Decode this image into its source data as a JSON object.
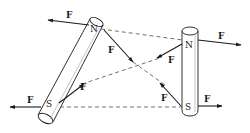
{
  "diagram": {
    "colors": {
      "stroke": "#1a1a1a",
      "fill": "#ffffff",
      "dash": "#333333"
    },
    "magnets": [
      {
        "id": "tilted-magnet",
        "north_label": "N",
        "south_label": "S"
      },
      {
        "id": "vertical-magnet",
        "north_label": "N",
        "south_label": "S"
      }
    ],
    "force_label": "F",
    "forces": [
      {
        "id": "f-n1-left",
        "label": "F",
        "from": "tilted N",
        "direction": "left (repulsion away from N2)"
      },
      {
        "id": "f-n1-toward-s2",
        "label": "F",
        "from": "tilted N",
        "direction": "toward vertical S (attraction)"
      },
      {
        "id": "f-s1-left",
        "label": "F",
        "from": "tilted S",
        "direction": "left (repulsion away from S2)"
      },
      {
        "id": "f-s1-toward-n2",
        "label": "F",
        "from": "tilted S",
        "direction": "toward vertical N (attraction)"
      },
      {
        "id": "f-n2-right",
        "label": "F",
        "from": "vertical N",
        "direction": "right (repulsion away from N1)"
      },
      {
        "id": "f-n2-toward-s1",
        "label": "F",
        "from": "vertical N",
        "direction": "toward tilted S (attraction)"
      },
      {
        "id": "f-s2-right",
        "label": "F",
        "from": "vertical S",
        "direction": "right (repulsion away from S1)"
      },
      {
        "id": "f-s2-toward-n1",
        "label": "F",
        "from": "vertical S",
        "direction": "toward tilted N (attraction)"
      }
    ]
  }
}
